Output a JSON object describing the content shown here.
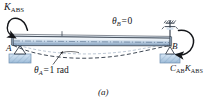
{
  "figure": {
    "caption": "(a)",
    "domain": "structural-engineering-beam-diagram",
    "description_labels": {
      "applied_moment": {
        "symbol": "K",
        "subscript": "ABS",
        "full_text": "K_ABS"
      },
      "carryover_moment": {
        "coefficient_symbol": "C",
        "coefficient_subscript": "AB",
        "stiffness_symbol": "K",
        "stiffness_subscript": "ABS",
        "full_text": "C_AB K_ABS"
      },
      "rotation_a": {
        "symbol": "θ",
        "subscript": "A",
        "equals": "=",
        "value": "1 rad",
        "full_text": "θ_A = 1 rad"
      },
      "rotation_b": {
        "symbol": "θ",
        "subscript": "B",
        "equals": "=",
        "value": "0",
        "full_text": "θ_B = 0"
      },
      "node_a": "A",
      "node_b": "B"
    },
    "colors": {
      "beam_light": "#e8eef6",
      "beam_mid": "#b9cbe0",
      "beam_dark": "#7f99b8",
      "beam_outline": "#2a3442",
      "support_fill": "#c9dcef",
      "support_edge": "#5f7governed",
      "hatch": "#8fb0cf",
      "ink": "#14161a",
      "dashed_curve": "#2a3442"
    },
    "elements": {
      "beam": "horizontal-beam-3d-bar",
      "left_support": "pin-support-triangle-on-hatched-base",
      "right_support": "roller-pin-support-with-fixed-rotational-restraint",
      "deflection_curve": "dashed-sagging-curve",
      "left_moment_arrow": "counterclockwise-curved-arrow",
      "right_moment_arrow": "clockwise-curved-arrow",
      "leader_line_theta_a": "thin-leader-line-to-deflected-shape",
      "tick_mark_midspan": "small-vertical-tick-on-beam"
    }
  }
}
